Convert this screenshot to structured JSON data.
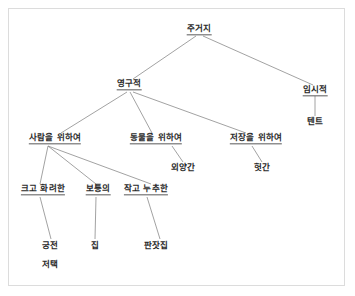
{
  "diagram": {
    "title_text": "주거지",
    "type": "tree-hierarchy",
    "background_color": "#ffffff",
    "border_color": "#dcdcdc",
    "line_color": "#8a8a8a",
    "text_color": "#2a2a2a",
    "nodes": [
      {
        "id": "root",
        "label": "주거지",
        "x": 199,
        "y": 30,
        "underline": true
      },
      {
        "id": "permanent",
        "label": "영구적",
        "x": 129,
        "y": 85,
        "underline": true
      },
      {
        "id": "temporary",
        "label": "임시적",
        "x": 315,
        "y": 91,
        "underline": true
      },
      {
        "id": "tent",
        "label": "텐트",
        "x": 315,
        "y": 122,
        "underline": false
      },
      {
        "id": "for-people",
        "label": "사람을 위하여",
        "x": 55,
        "y": 139,
        "underline": true
      },
      {
        "id": "for-animals",
        "label": "동물을 위하여",
        "x": 156,
        "y": 139,
        "underline": true
      },
      {
        "id": "for-storage",
        "label": "저장을 위하여",
        "x": 256,
        "y": 139,
        "underline": true
      },
      {
        "id": "barn",
        "label": "외양간",
        "x": 183,
        "y": 168,
        "underline": false
      },
      {
        "id": "shed",
        "label": "헛간",
        "x": 262,
        "y": 168,
        "underline": false
      },
      {
        "id": "grand",
        "label": "크고 화려한",
        "x": 43,
        "y": 190,
        "underline": true
      },
      {
        "id": "ordinary",
        "label": "보통의",
        "x": 98,
        "y": 190,
        "underline": true
      },
      {
        "id": "humble",
        "label": "작고 누추한",
        "x": 146,
        "y": 190,
        "underline": true
      },
      {
        "id": "palace",
        "label": "궁전",
        "x": 50,
        "y": 246,
        "underline": false
      },
      {
        "id": "mansion",
        "label": "저택",
        "x": 50,
        "y": 265,
        "underline": false
      },
      {
        "id": "house",
        "label": "집",
        "x": 95,
        "y": 246,
        "underline": false
      },
      {
        "id": "shanty",
        "label": "판잣집",
        "x": 156,
        "y": 246,
        "underline": false
      }
    ],
    "edges": [
      {
        "from": "root",
        "to": "permanent",
        "x1": 196,
        "y1": 36,
        "x2": 133,
        "y2": 79
      },
      {
        "from": "root",
        "to": "temporary",
        "x1": 203,
        "y1": 36,
        "x2": 313,
        "y2": 85
      },
      {
        "from": "temporary",
        "to": "tent",
        "x1": 315,
        "y1": 96,
        "x2": 315,
        "y2": 116
      },
      {
        "from": "permanent",
        "to": "for-people",
        "x1": 127,
        "y1": 92,
        "x2": 61,
        "y2": 133
      },
      {
        "from": "permanent",
        "to": "for-animals",
        "x1": 130,
        "y1": 92,
        "x2": 152,
        "y2": 133
      },
      {
        "from": "permanent",
        "to": "for-storage",
        "x1": 133,
        "y1": 92,
        "x2": 246,
        "y2": 133
      },
      {
        "from": "for-animals",
        "to": "barn",
        "x1": 172,
        "y1": 146,
        "x2": 183,
        "y2": 162
      },
      {
        "from": "for-storage",
        "to": "shed",
        "x1": 252,
        "y1": 146,
        "x2": 262,
        "y2": 162
      },
      {
        "from": "for-people",
        "to": "grand",
        "x1": 48,
        "y1": 146,
        "x2": 40,
        "y2": 184
      },
      {
        "from": "for-people",
        "to": "ordinary",
        "x1": 48,
        "y1": 146,
        "x2": 96,
        "y2": 184
      },
      {
        "from": "for-people",
        "to": "humble",
        "x1": 48,
        "y1": 146,
        "x2": 151,
        "y2": 184
      },
      {
        "from": "grand",
        "to": "palace",
        "x1": 40,
        "y1": 197,
        "x2": 51,
        "y2": 239
      },
      {
        "from": "ordinary",
        "to": "house",
        "x1": 96,
        "y1": 197,
        "x2": 95,
        "y2": 239
      },
      {
        "from": "humble",
        "to": "shanty",
        "x1": 147,
        "y1": 197,
        "x2": 160,
        "y2": 239
      }
    ]
  }
}
